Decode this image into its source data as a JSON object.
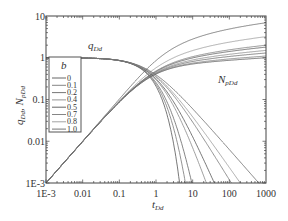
{
  "chart_data": {
    "type": "line",
    "title": "",
    "xlabel": "t_Dd",
    "ylabel": "q_Dd, N_pDd",
    "xscale": "log",
    "yscale": "log",
    "xlim": [
      0.001,
      1000
    ],
    "ylim": [
      0.001,
      10
    ],
    "x_ticks": [
      "1E-3",
      "0.01",
      "0.1",
      "1",
      "10",
      "100",
      "1000"
    ],
    "y_ticks": [
      "1E-3",
      "0.01",
      "0.1",
      "1",
      "10"
    ],
    "grid": false,
    "legend": {
      "title": "b",
      "position": "left-middle",
      "entries": [
        "0",
        "0.1",
        "0.2",
        "0.4",
        "0.5",
        "0.7",
        "0.8",
        "1.0"
      ]
    },
    "annotations": [
      {
        "text": "q",
        "sub": "Dd",
        "x": 0.01,
        "y": 1.3
      },
      {
        "text": "N",
        "sub": "pDd",
        "x": 20,
        "y": 0.55
      }
    ],
    "series_families": [
      {
        "name": "q_Dd",
        "description": "rate decline curves, start at 1.0 and decline after t_Dd ~ 0.7",
        "b_values": [
          0,
          0.1,
          0.2,
          0.4,
          0.5,
          0.7,
          0.8,
          1.0
        ]
      },
      {
        "name": "N_pDd",
        "description": "cumulative curves, rise from 1E-3 at t=1E-3 with unit slope, plateau after t_Dd ~ 1",
        "end_values_at_1000": {
          "0": 1.0,
          "0.1": 1.1,
          "0.2": 1.3,
          "0.4": 1.5,
          "0.5": 1.8,
          "0.7": 2.0,
          "0.8": 3.2,
          "1.0": 6.9
        }
      }
    ],
    "crossover": {
      "t_Dd": 0.7,
      "value": 0.57
    }
  },
  "labels": {
    "x_axis_main": "t",
    "x_axis_sub": "Dd",
    "y_axis": "q",
    "y_axis_sub1": "Dd",
    "y_axis_mid": ", N",
    "y_axis_sub2": "pDd",
    "legend_title": "b",
    "q_label": "q",
    "q_label_sub": "Dd",
    "n_label": "N",
    "n_label_sub": "pDd"
  }
}
